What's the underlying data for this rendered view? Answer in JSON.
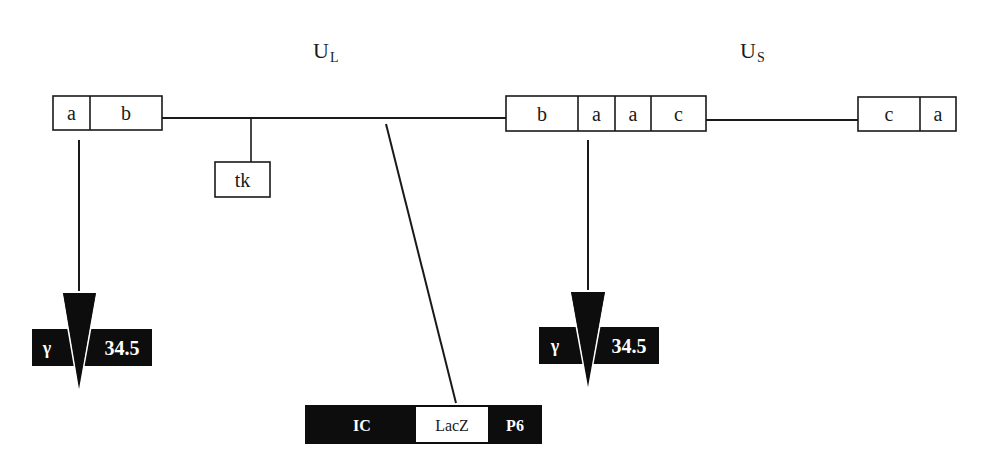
{
  "regions": {
    "unique_long": {
      "main": "U",
      "sub": "L"
    },
    "unique_short": {
      "main": "U",
      "sub": "S"
    }
  },
  "left_repeat": {
    "segments": [
      "a",
      "b"
    ]
  },
  "internal_repeat": {
    "segments": [
      "b",
      "a",
      "a",
      "c"
    ]
  },
  "right_repeat": {
    "segments": [
      "c",
      "a"
    ]
  },
  "tk_gene": {
    "label": "tk"
  },
  "gamma_insertions": [
    {
      "gene_prefix": "γ",
      "gene_suffix": "34.5"
    },
    {
      "gene_prefix": "γ",
      "gene_suffix": "34.5"
    }
  ],
  "reporter_cassette": {
    "promoter": "IC",
    "reporter": "LacZ",
    "polyA": "P6"
  },
  "colors": {
    "line": "#1a1a1a",
    "fill_dark": "#0d0d0d",
    "fill_light": "#ffffff"
  }
}
